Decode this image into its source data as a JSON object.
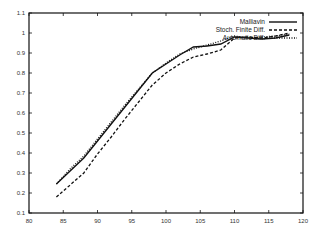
{
  "chart_data": {
    "type": "line",
    "title": "",
    "xlabel": "",
    "ylabel": "",
    "xlim": [
      80,
      120
    ],
    "ylim": [
      0.1,
      1.1
    ],
    "xticks": [
      80,
      85,
      90,
      95,
      100,
      105,
      110,
      115,
      120
    ],
    "yticks": [
      0.1,
      0.2,
      0.3,
      0.4,
      0.5,
      0.6,
      0.7,
      0.8,
      0.9,
      1,
      1.1
    ],
    "grid": false,
    "legend_position": "top-right",
    "x": [
      84,
      86,
      88,
      90,
      92,
      94,
      96,
      98,
      100,
      102,
      104,
      106,
      108,
      110,
      112,
      114,
      116,
      118
    ],
    "series": [
      {
        "name": "Malliavin",
        "style": "solid",
        "values": [
          0.245,
          0.31,
          0.375,
          0.46,
          0.545,
          0.63,
          0.715,
          0.8,
          0.845,
          0.89,
          0.93,
          0.935,
          0.945,
          0.98,
          0.975,
          0.97,
          0.975,
          0.99
        ]
      },
      {
        "name": "Stoch. Finite Diff.",
        "style": "dashed",
        "values": [
          0.18,
          0.24,
          0.3,
          0.395,
          0.48,
          0.57,
          0.655,
          0.74,
          0.8,
          0.845,
          0.88,
          0.895,
          0.915,
          0.975,
          0.98,
          0.975,
          0.985,
          1.0
        ]
      },
      {
        "name": "Automatic Diff.",
        "style": "dotted",
        "values": [
          0.245,
          0.32,
          0.385,
          0.47,
          0.555,
          0.64,
          0.72,
          0.8,
          0.85,
          0.895,
          0.92,
          0.94,
          0.96,
          0.985,
          0.975,
          0.98,
          0.985,
          0.995
        ]
      }
    ]
  },
  "legend": {
    "items": [
      {
        "label": "Malliavin"
      },
      {
        "label": "Stoch. Finite Diff."
      },
      {
        "label": "Automatic Diff."
      }
    ]
  }
}
